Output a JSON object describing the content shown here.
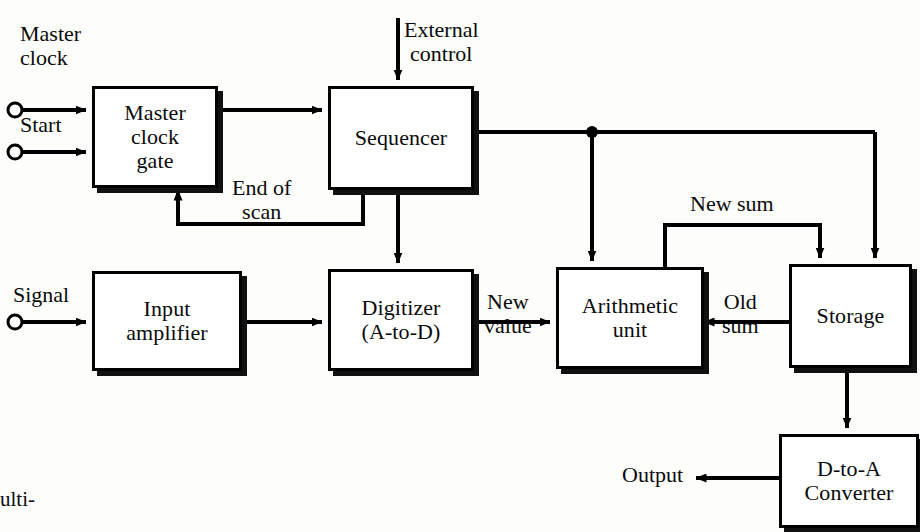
{
  "diagram": {
    "ink_color": "#000000",
    "background_color": "#fdfdfb",
    "blocks": [
      {
        "id": "master_clock_gate",
        "label": "Master\nclock\ngate",
        "x": 92,
        "y": 86,
        "w": 120,
        "h": 96
      },
      {
        "id": "sequencer",
        "label": "Sequencer",
        "x": 328,
        "y": 86,
        "w": 140,
        "h": 98
      },
      {
        "id": "input_amplifier",
        "label": "Input\namplifier",
        "x": 92,
        "y": 271,
        "w": 144,
        "h": 94
      },
      {
        "id": "digitizer",
        "label": "Digitizer\n(A-to-D)",
        "x": 328,
        "y": 269,
        "w": 140,
        "h": 96
      },
      {
        "id": "arithmetic_unit",
        "label": "Arithmetic\nunit",
        "x": 556,
        "y": 267,
        "w": 142,
        "h": 96
      },
      {
        "id": "storage",
        "label": "Storage",
        "x": 789,
        "y": 264,
        "w": 117,
        "h": 98
      },
      {
        "id": "d_to_a_converter",
        "label": "D-to-A\nConverter",
        "x": 779,
        "y": 434,
        "w": 134,
        "h": 88
      }
    ],
    "terminals": [
      {
        "id": "master_clock_terminal",
        "label": "Master\nclock",
        "cx": 15,
        "cy": 110
      },
      {
        "id": "start_terminal",
        "label": "Start",
        "cx": 15,
        "cy": 152
      },
      {
        "id": "signal_terminal",
        "label": "Signal",
        "cx": 15,
        "cy": 322
      }
    ],
    "signal_labels": [
      {
        "id": "external_control",
        "text": "External\ncontrol",
        "x": 404,
        "y": 18
      },
      {
        "id": "end_of_scan",
        "text": "End of\nscan",
        "x": 232,
        "y": 176
      },
      {
        "id": "new_value",
        "text": "New\nvalue",
        "x": 484,
        "y": 290
      },
      {
        "id": "new_sum",
        "text": "New sum",
        "x": 690,
        "y": 192
      },
      {
        "id": "old_sum",
        "text": "Old\nsum",
        "x": 722,
        "y": 290
      },
      {
        "id": "output",
        "text": "Output",
        "x": 632,
        "y": 463
      }
    ],
    "caption_fragment": "ulti-"
  }
}
